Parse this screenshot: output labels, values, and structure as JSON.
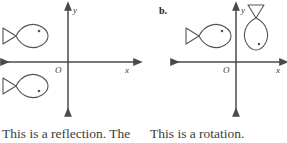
{
  "figure": {
    "background_color": "#ffffff",
    "stroke_color": "#4a4a4a",
    "shape_stroke_color": "#555555",
    "text_color": "#3c3c3c"
  },
  "panels": [
    {
      "id": "a",
      "part_label": "",
      "axes": {
        "x_axis_label": "x",
        "y_axis_label": "y",
        "origin_label": "O"
      },
      "shapes": [
        {
          "name": "fish-preimage",
          "description": "fish pointing right, above x-axis, left of y-axis",
          "eye_dot": true
        },
        {
          "name": "fish-image",
          "description": "fish pointing right, below x-axis, left of y-axis, reflected over x-axis",
          "eye_dot": true
        }
      ],
      "caption": "This is a reflection. The"
    },
    {
      "id": "b",
      "part_label": "b.",
      "axes": {
        "x_axis_label": "x",
        "y_axis_label": "y",
        "origin_label": "O"
      },
      "shapes": [
        {
          "name": "fish-preimage",
          "description": "fish pointing right, above x-axis, left of y-axis",
          "eye_dot": true
        },
        {
          "name": "fish-image",
          "description": "fish pointing down, above x-axis, right of y-axis, rotated 90 degrees",
          "eye_dot": true
        }
      ],
      "caption": "This is a rotation."
    }
  ]
}
